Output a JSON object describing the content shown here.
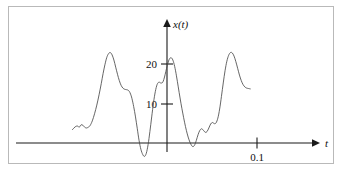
{
  "figure": {
    "title": "",
    "background_color": "#ffffff",
    "frame_color": "#b9b9b9",
    "axis_color": "#1a1a1a",
    "curve_color": "#4a4a4a"
  },
  "labels": {
    "y_axis_label": "x(t)",
    "x_axis_label": "t",
    "y_tick_20": "20",
    "y_tick_10": "10",
    "x_tick_01": "0.1"
  },
  "chart_data": {
    "type": "line",
    "title": "",
    "xlabel": "t",
    "ylabel": "x(t)",
    "grid": false,
    "legend": null,
    "xlim": [
      -0.105,
      0.095
    ],
    "ylim": [
      -5,
      27
    ],
    "y_ticks": [
      10,
      20
    ],
    "y_tick_labels": [
      "10",
      "20"
    ],
    "x_ticks": [
      0.1
    ],
    "x_tick_labels": [
      "0.1"
    ],
    "axis_origin_note": "y-axis drawn at t = 0; t-axis drawn at x = 0",
    "series": [
      {
        "name": "x(t)",
        "x": [
          -0.105,
          -0.102,
          -0.0995,
          -0.0975,
          -0.0955,
          -0.0935,
          -0.0915,
          -0.0895,
          -0.0875,
          -0.0855,
          -0.083,
          -0.0805,
          -0.078,
          -0.0755,
          -0.073,
          -0.071,
          -0.069,
          -0.067,
          -0.065,
          -0.063,
          -0.061,
          -0.059,
          -0.057,
          -0.055,
          -0.053,
          -0.051,
          -0.049,
          -0.047,
          -0.045,
          -0.0435,
          -0.042,
          -0.0405,
          -0.039,
          -0.037,
          -0.035,
          -0.033,
          -0.031,
          -0.029,
          -0.027,
          -0.025,
          -0.023,
          -0.021,
          -0.019,
          -0.017,
          -0.015,
          -0.013,
          -0.011,
          -0.009,
          -0.007,
          -0.005,
          -0.0035,
          -0.002,
          -0.0005,
          0.001,
          0.0025,
          0.0045,
          0.0065,
          0.0085,
          0.0105,
          0.0125,
          0.0145,
          0.0165,
          0.0185,
          0.0205,
          0.0225,
          0.0245,
          0.0265,
          0.0285,
          0.0305,
          0.0325,
          0.0345,
          0.0365,
          0.0385,
          0.0405,
          0.0425,
          0.0445,
          0.0465,
          0.0485,
          0.0505,
          0.0525,
          0.0545,
          0.0565,
          0.0585,
          0.0605,
          0.0625,
          0.0645,
          0.0665,
          0.0685,
          0.0705,
          0.0725,
          0.0745,
          0.0765,
          0.0785,
          0.0805,
          0.0825,
          0.0845,
          0.0865,
          0.0885,
          0.0905,
          0.0925
        ],
        "values": [
          3.4,
          4.1,
          4.3,
          4.0,
          4.6,
          4.5,
          4.0,
          3.8,
          4.0,
          4.4,
          5.6,
          7.4,
          9.6,
          12.2,
          15.1,
          17.6,
          19.8,
          21.6,
          22.6,
          22.9,
          22.3,
          21.0,
          19.2,
          17.4,
          15.8,
          14.6,
          13.9,
          13.6,
          13.5,
          13.4,
          13.1,
          12.4,
          11.3,
          9.2,
          6.6,
          3.6,
          0.6,
          -1.6,
          -2.9,
          -3.4,
          -2.6,
          -0.4,
          2.9,
          6.6,
          10.2,
          13.0,
          14.8,
          15.4,
          15.2,
          15.3,
          16.1,
          17.4,
          18.9,
          20.2,
          21.2,
          21.6,
          21.0,
          19.4,
          17.0,
          14.2,
          11.4,
          8.8,
          6.4,
          4.2,
          2.3,
          0.8,
          -0.3,
          -0.9,
          -0.6,
          0.6,
          2.1,
          3.2,
          3.6,
          3.2,
          2.7,
          2.9,
          3.8,
          4.8,
          5.2,
          4.9,
          5.1,
          6.3,
          8.6,
          11.8,
          15.2,
          18.3,
          20.7,
          22.2,
          22.9,
          22.8,
          22.0,
          20.6,
          18.9,
          17.2,
          15.8,
          14.8,
          14.2,
          13.9,
          13.8,
          13.7
        ]
      }
    ]
  }
}
